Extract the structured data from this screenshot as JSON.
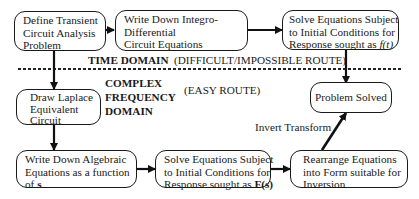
{
  "diagram": {
    "nodes": {
      "define": {
        "lines": [
          "Define Transient",
          "Circuit Analysis",
          "Problem"
        ]
      },
      "integro": {
        "lines": [
          "Write Down Integro-",
          "Differential",
          "Circuit Equations"
        ]
      },
      "solve_time": {
        "lines": [
          "Solve Equations Subject",
          "to Initial Conditions for",
          "Response sought as "
        ],
        "var": "f(t)"
      },
      "laplace": {
        "lines": [
          "Draw Laplace",
          "Equivalent",
          "Circuit"
        ]
      },
      "solved": {
        "label": "Problem Solved"
      },
      "algebraic": {
        "lines": [
          "Write Down Algebraic",
          "Equations as a function",
          "of "
        ],
        "var": "s"
      },
      "solve_freq": {
        "lines": [
          "Solve Equations Subject",
          "to Initial Conditions for",
          "Response sought as "
        ],
        "var": "F(s)"
      },
      "rearrange": {
        "lines": [
          "Rearrange Equations",
          "into Form suitable for",
          "Inversion"
        ]
      }
    },
    "labels": {
      "time_domain": "TIME DOMAIN",
      "difficult_route": "(DIFFICULT/IMPOSSIBLE ROUTE)",
      "complex": "COMPLEX",
      "frequency": "FREQUENCY",
      "domain": "DOMAIN",
      "easy_route": "(EASY ROUTE)",
      "invert_transform": "Invert Transform"
    }
  }
}
